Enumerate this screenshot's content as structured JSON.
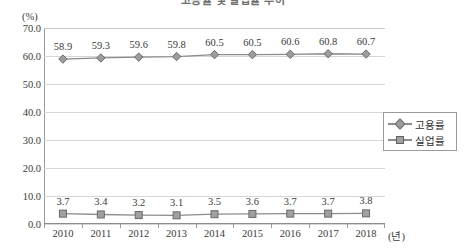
{
  "title": {
    "text": "고용률 및 실업률 추이",
    "clipped": true
  },
  "axis": {
    "y_unit": "(%)",
    "x_unit": "(년)",
    "y_ticks": [
      "70.0",
      "60.0",
      "50.0",
      "40.0",
      "30.0",
      "20.0",
      "10.0",
      "0.0"
    ]
  },
  "legend": {
    "position": "right",
    "items": [
      {
        "label": "고용률",
        "marker": "diamond-marker-icon",
        "color": "#9c9c9c"
      },
      {
        "label": "실업률",
        "marker": "square-marker-icon",
        "color": "#a0a0a0"
      }
    ]
  },
  "chart_data": {
    "type": "line",
    "title": "고용률 및 실업률 추이",
    "xlabel": "(년)",
    "ylabel": "(%)",
    "ylim": [
      0,
      70
    ],
    "ytick_step": 10,
    "grid": true,
    "legend_position": "right",
    "categories": [
      "2010",
      "2011",
      "2012",
      "2013",
      "2014",
      "2015",
      "2016",
      "2017",
      "2018"
    ],
    "series": [
      {
        "name": "고용률",
        "marker": "diamond",
        "color": "#9c9c9c",
        "values": [
          58.9,
          59.3,
          59.6,
          59.8,
          60.5,
          60.5,
          60.6,
          60.8,
          60.7
        ],
        "labels": [
          "58.9",
          "59.3",
          "59.6",
          "59.8",
          "60.5",
          "60.5",
          "60.6",
          "60.8",
          "60.7"
        ]
      },
      {
        "name": "실업률",
        "marker": "square",
        "color": "#a0a0a0",
        "values": [
          3.7,
          3.4,
          3.2,
          3.1,
          3.5,
          3.6,
          3.7,
          3.7,
          3.8
        ],
        "labels": [
          "3.7",
          "3.4",
          "3.2",
          "3.1",
          "3.5",
          "3.6",
          "3.7",
          "3.7",
          "3.8"
        ]
      }
    ]
  }
}
